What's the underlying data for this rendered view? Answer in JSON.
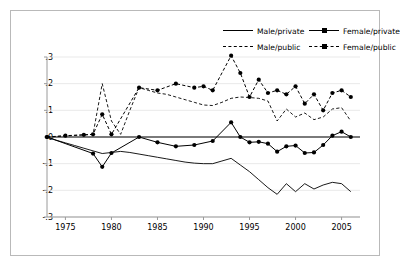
{
  "legend": {
    "position": "top-right",
    "entries": [
      {
        "label": "Male/private",
        "style": "solid",
        "marker": false
      },
      {
        "label": "Male/public",
        "style": "dashed",
        "marker": false
      },
      {
        "label": "Female/private",
        "style": "solid",
        "marker": true
      },
      {
        "label": "Female/public",
        "style": "dashed",
        "marker": true
      }
    ]
  },
  "chart_data": {
    "type": "line",
    "title": "",
    "xlabel": "",
    "ylabel": "",
    "xlim": [
      1973,
      2007
    ],
    "ylim": [
      -0.3,
      0.3
    ],
    "grid": true,
    "xticks": [
      1975,
      1980,
      1985,
      1990,
      1995,
      2000,
      2005
    ],
    "xticklabels": [
      "1975",
      "1980",
      "1985",
      "1990",
      "1995",
      "2000",
      "2005"
    ],
    "yticks": [
      0.3,
      0.2,
      0.1,
      0,
      -0.1,
      -0.2,
      -0.3
    ],
    "yticklabels": [
      ".3",
      ".2",
      ".1",
      "0",
      "-.1",
      "-.2",
      "-.3"
    ],
    "zero_line": 0,
    "series": [
      {
        "name": "Male/private",
        "style": "solid",
        "marker": false,
        "color": "#000000",
        "x": [
          1973,
          1974,
          1975,
          1976,
          1977,
          1978,
          1979,
          1980,
          1981,
          1982,
          1983,
          1984,
          1985,
          1986,
          1987,
          1988,
          1989,
          1990,
          1991,
          1992,
          1993,
          1994,
          1995,
          1996,
          1997,
          1998,
          1999,
          2000,
          2001,
          2002,
          2003,
          2004,
          2005,
          2006
        ],
        "y": [
          0.0,
          -0.012,
          -0.022,
          -0.032,
          -0.042,
          -0.052,
          -0.062,
          -0.058,
          -0.054,
          -0.058,
          -0.064,
          -0.07,
          -0.076,
          -0.082,
          -0.088,
          -0.094,
          -0.098,
          -0.1,
          -0.1,
          -0.09,
          -0.08,
          -0.105,
          -0.13,
          -0.16,
          -0.19,
          -0.215,
          -0.175,
          -0.205,
          -0.175,
          -0.195,
          -0.18,
          -0.17,
          -0.175,
          -0.205
        ]
      },
      {
        "name": "Male/public",
        "style": "dashed",
        "marker": false,
        "color": "#000000",
        "x": [
          1973,
          1974,
          1975,
          1976,
          1977,
          1978,
          1979,
          1980,
          1981,
          1982,
          1983,
          1984,
          1985,
          1986,
          1987,
          1988,
          1989,
          1990,
          1991,
          1992,
          1993,
          1994,
          1995,
          1996,
          1997,
          1998,
          1999,
          2000,
          2001,
          2002,
          2003,
          2004,
          2005,
          2006
        ],
        "y": [
          0.0,
          0.002,
          0.004,
          0.006,
          0.008,
          0.01,
          0.2,
          0.06,
          0.01,
          0.1,
          0.185,
          0.175,
          0.165,
          0.16,
          0.15,
          0.14,
          0.13,
          0.12,
          0.118,
          0.13,
          0.145,
          0.15,
          0.148,
          0.145,
          0.135,
          0.06,
          0.105,
          0.075,
          0.09,
          0.065,
          0.075,
          0.105,
          0.11,
          0.06
        ]
      },
      {
        "name": "Female/private",
        "style": "solid",
        "marker": true,
        "color": "#000000",
        "x": [
          1973,
          1978,
          1979,
          1980,
          1983,
          1985,
          1987,
          1989,
          1991,
          1993,
          1994,
          1995,
          1996,
          1997,
          1998,
          1999,
          2000,
          2001,
          2002,
          2003,
          2004,
          2005,
          2006
        ],
        "y": [
          0.0,
          -0.062,
          -0.112,
          -0.06,
          0.0,
          -0.02,
          -0.035,
          -0.03,
          -0.015,
          0.055,
          0.0,
          -0.02,
          -0.018,
          -0.025,
          -0.055,
          -0.035,
          -0.032,
          -0.06,
          -0.058,
          -0.03,
          0.005,
          0.02,
          0.0
        ]
      },
      {
        "name": "Female/public",
        "style": "dashed",
        "marker": true,
        "color": "#000000",
        "x": [
          1973,
          1975,
          1977,
          1978,
          1979,
          1980,
          1983,
          1985,
          1987,
          1989,
          1990,
          1991,
          1993,
          1994,
          1995,
          1996,
          1997,
          1998,
          1999,
          2000,
          2001,
          2002,
          2003,
          2004,
          2005,
          2006
        ],
        "y": [
          0.0,
          0.005,
          0.008,
          0.01,
          0.085,
          0.01,
          0.185,
          0.175,
          0.2,
          0.185,
          0.19,
          0.175,
          0.305,
          0.24,
          0.15,
          0.215,
          0.165,
          0.175,
          0.16,
          0.19,
          0.125,
          0.16,
          0.1,
          0.165,
          0.175,
          0.15
        ]
      }
    ]
  }
}
